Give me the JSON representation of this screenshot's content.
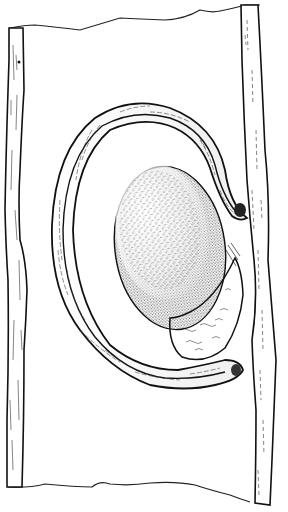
{
  "figure": {
    "type": "scientific pen-and-ink illustration",
    "background": "#ffffff",
    "ink": "#111111",
    "elements": [
      "left-wall",
      "right-wall",
      "top-torn-edge",
      "bottom-torn-edge",
      "outer-curved-band",
      "stippled-oval-body",
      "lower-textured-lobe"
    ]
  }
}
